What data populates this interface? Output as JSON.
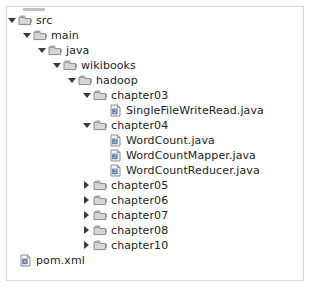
{
  "panel": {
    "name": "project-file-tree",
    "background": "#ffffff",
    "border_color": "#d8d8d8",
    "scrollbar_visible": true
  },
  "icons": {
    "folder": "folder-icon",
    "java_file": "java-file-icon",
    "xml_file": "xml-file-icon",
    "expanded": "triangle-down-icon",
    "collapsed": "triangle-right-icon"
  },
  "colors": {
    "text": "#1c1c1c",
    "folder_fill": "#d6d6d6",
    "folder_stroke": "#8a8a8a",
    "file_fill": "#f4f4f4",
    "file_stroke": "#8a8a8a",
    "file_glyph": "#5b7fb5",
    "twisty": "#3a3a3a"
  },
  "tree": [
    {
      "label": "src",
      "depth": 0,
      "type": "folder",
      "state": "expanded"
    },
    {
      "label": "main",
      "depth": 1,
      "type": "folder",
      "state": "expanded"
    },
    {
      "label": "java",
      "depth": 2,
      "type": "folder",
      "state": "expanded"
    },
    {
      "label": "wikibooks",
      "depth": 3,
      "type": "folder",
      "state": "expanded"
    },
    {
      "label": "hadoop",
      "depth": 4,
      "type": "folder",
      "state": "expanded"
    },
    {
      "label": "chapter03",
      "depth": 5,
      "type": "folder",
      "state": "expanded"
    },
    {
      "label": "SingleFileWriteRead.java",
      "depth": 6,
      "type": "java",
      "state": "leaf"
    },
    {
      "label": "chapter04",
      "depth": 5,
      "type": "folder",
      "state": "expanded"
    },
    {
      "label": "WordCount.java",
      "depth": 6,
      "type": "java",
      "state": "leaf"
    },
    {
      "label": "WordCountMapper.java",
      "depth": 6,
      "type": "java",
      "state": "leaf"
    },
    {
      "label": "WordCountReducer.java",
      "depth": 6,
      "type": "java",
      "state": "leaf"
    },
    {
      "label": "chapter05",
      "depth": 5,
      "type": "folder",
      "state": "collapsed"
    },
    {
      "label": "chapter06",
      "depth": 5,
      "type": "folder",
      "state": "collapsed"
    },
    {
      "label": "chapter07",
      "depth": 5,
      "type": "folder",
      "state": "collapsed"
    },
    {
      "label": "chapter08",
      "depth": 5,
      "type": "folder",
      "state": "collapsed"
    },
    {
      "label": "chapter10",
      "depth": 5,
      "type": "folder",
      "state": "collapsed"
    },
    {
      "label": "pom.xml",
      "depth": 0,
      "type": "xml",
      "state": "leaf"
    }
  ]
}
